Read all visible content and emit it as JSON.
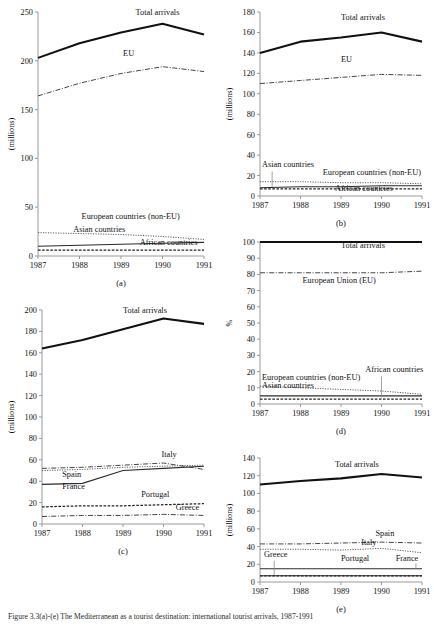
{
  "figure": {
    "caption": "Figure 3.3(a)-(e)  The Mediterranean as a tourist destination: international tourist arrivals, 1987-1991",
    "years": [
      1987,
      1988,
      1989,
      1990,
      1991
    ]
  },
  "chart_data": [
    {
      "id": "a",
      "type": "line",
      "panel_letter": "(a)",
      "title": "",
      "xlabel": "",
      "ylabel": "(millions)",
      "x": [
        1987,
        1988,
        1989,
        1990,
        1991
      ],
      "xticks": [
        "1987",
        "1988",
        "1989",
        "1990",
        "1991"
      ],
      "yticks": [
        0,
        50,
        100,
        150,
        200,
        250
      ],
      "ylim": [
        0,
        250
      ],
      "grid": false,
      "legend": "inline-labels",
      "series": [
        {
          "name": "Total arrivals",
          "style": "solid-thick",
          "values": [
            203,
            218,
            229,
            238,
            227
          ],
          "label_x": 1989.35,
          "label_y": 247
        },
        {
          "name": "EU",
          "style": "dashdot",
          "values": [
            164,
            177,
            187,
            194,
            189
          ],
          "label_x": 1989.05,
          "label_y": 205
        },
        {
          "name": "European countries (non-EU)",
          "style": "dotted",
          "values": [
            24,
            23,
            22,
            20,
            17
          ],
          "label_x": 1988.05,
          "label_y": 38
        },
        {
          "name": "Asian countries",
          "style": "solid-thin",
          "values": [
            10,
            11,
            12,
            13,
            14
          ],
          "label_x": 1987.85,
          "label_y": 25
        },
        {
          "name": "African countries",
          "style": "dashed",
          "values": [
            6,
            6,
            6,
            6,
            6
          ],
          "label_x": 1989.45,
          "label_y": 11
        }
      ]
    },
    {
      "id": "b",
      "type": "line",
      "panel_letter": "(b)",
      "title": "",
      "xlabel": "",
      "ylabel": "(millions)",
      "x": [
        1987,
        1988,
        1989,
        1990,
        1991
      ],
      "xticks": [
        "1987",
        "1988",
        "1989",
        "1990",
        "1991"
      ],
      "yticks": [
        0,
        20,
        40,
        60,
        80,
        100,
        120,
        140,
        160,
        180
      ],
      "ylim": [
        0,
        180
      ],
      "grid": false,
      "legend": "inline-labels",
      "series": [
        {
          "name": "Total arrivals",
          "style": "solid-thick",
          "values": [
            140,
            151,
            155,
            160,
            151
          ],
          "label_x": 1989.0,
          "label_y": 172
        },
        {
          "name": "EU",
          "style": "dashdot",
          "values": [
            110,
            113,
            116,
            119,
            118
          ],
          "label_x": 1989.0,
          "label_y": 131
        },
        {
          "name": "Asian countries",
          "style": "solid-thin",
          "values": [
            8,
            9,
            9,
            10,
            10
          ],
          "label_x": 1987.05,
          "label_y": 28,
          "leader": {
            "x": 1987.3,
            "y0": 24,
            "y1": 9
          }
        },
        {
          "name": "European countries (non-EU)",
          "style": "dotted",
          "values": [
            14,
            14,
            13,
            13,
            12
          ],
          "label_x": 1988.55,
          "label_y": 21
        },
        {
          "name": "African countries",
          "style": "dashed",
          "values": [
            7,
            7,
            7,
            7,
            7
          ],
          "label_x": 1988.85,
          "label_y": 5
        }
      ]
    },
    {
      "id": "c",
      "type": "line",
      "panel_letter": "(c)",
      "title": "",
      "xlabel": "",
      "ylabel": "(millions)",
      "x": [
        1987,
        1988,
        1989,
        1990,
        1991
      ],
      "xticks": [
        "1987",
        "1988",
        "1989",
        "1990",
        "1991"
      ],
      "yticks": [
        0,
        20,
        40,
        60,
        80,
        100,
        120,
        140,
        160,
        180,
        200
      ],
      "ylim": [
        0,
        200
      ],
      "grid": false,
      "legend": "inline-labels",
      "series": [
        {
          "name": "Total arrivals",
          "style": "solid-thick",
          "values": [
            164,
            172,
            182,
            192,
            187
          ],
          "label_x": 1989.0,
          "label_y": 197
        },
        {
          "name": "Italy",
          "style": "dashdot",
          "values": [
            52,
            53,
            55,
            57,
            51
          ],
          "label_x": 1989.95,
          "label_y": 63
        },
        {
          "name": "Spain",
          "style": "dotted",
          "values": [
            50,
            51,
            53,
            54,
            55
          ],
          "label_x": 1987.5,
          "label_y": 44
        },
        {
          "name": "France",
          "style": "solid-thin",
          "values": [
            37,
            38,
            50,
            52,
            54
          ],
          "label_x": 1987.5,
          "label_y": 33
        },
        {
          "name": "Portugal",
          "style": "dashed",
          "values": [
            16,
            17,
            17,
            18,
            19
          ],
          "label_x": 1989.45,
          "label_y": 25
        },
        {
          "name": "Greece",
          "style": "dashdot",
          "values": [
            7,
            8,
            8,
            9,
            8
          ],
          "label_x": 1990.3,
          "label_y": 13
        }
      ]
    },
    {
      "id": "d",
      "type": "line",
      "panel_letter": "(d)",
      "title": "",
      "xlabel": "",
      "ylabel": "%",
      "x": [
        1987,
        1988,
        1989,
        1990,
        1991
      ],
      "xticks": [
        "1987",
        "1988",
        "1989",
        "1990",
        "1991"
      ],
      "yticks": [
        0,
        10,
        20,
        30,
        40,
        50,
        60,
        70,
        80,
        90,
        100
      ],
      "ylim": [
        0,
        100
      ],
      "grid": false,
      "legend": "inline-labels",
      "series": [
        {
          "name": "Total arrivals",
          "style": "solid-thick",
          "values": [
            100,
            100,
            100,
            100,
            100
          ],
          "label_x": 1989.0,
          "label_y": 96
        },
        {
          "name": "European Union (EU)",
          "style": "dashdot",
          "values": [
            81,
            81,
            81,
            81,
            82
          ],
          "label_x": 1988.05,
          "label_y": 75
        },
        {
          "name": "European countries (non-EU)",
          "style": "dotted",
          "values": [
            11,
            10,
            9,
            8,
            6
          ],
          "label_x": 1987.05,
          "label_y": 15
        },
        {
          "name": "Asian countries",
          "style": "solid-thin",
          "values": [
            5,
            5,
            5,
            5,
            5
          ],
          "label_x": 1987.05,
          "label_y": 10
        },
        {
          "name": "African countries",
          "style": "dashed",
          "values": [
            3,
            3,
            3,
            3,
            3
          ],
          "label_x": 1989.6,
          "label_y": 20,
          "leader": {
            "x": 1990.0,
            "y0": 17,
            "y1": 4
          }
        }
      ]
    },
    {
      "id": "e",
      "type": "line",
      "panel_letter": "(e)",
      "title": "",
      "xlabel": "",
      "ylabel": "(millions)",
      "x": [
        1987,
        1988,
        1989,
        1990,
        1991
      ],
      "xticks": [
        "1987",
        "1988",
        "1989",
        "1990",
        "1991"
      ],
      "yticks": [
        0,
        20,
        40,
        60,
        80,
        100,
        120,
        140
      ],
      "ylim": [
        0,
        140
      ],
      "grid": false,
      "legend": "inline-labels",
      "series": [
        {
          "name": "Total arrivals",
          "style": "solid-thick",
          "values": [
            110,
            114,
            117,
            122,
            118
          ],
          "label_x": 1988.85,
          "label_y": 130
        },
        {
          "name": "Spain",
          "style": "dashdot",
          "values": [
            43,
            43,
            44,
            45,
            44
          ],
          "label_x": 1989.85,
          "label_y": 52
        },
        {
          "name": "Italy",
          "style": "dotted",
          "values": [
            37,
            37,
            36,
            38,
            33
          ],
          "label_x": 1989.5,
          "label_y": 42
        },
        {
          "name": "France",
          "style": "solid-thin",
          "values": [
            15,
            15,
            15,
            15,
            15
          ],
          "label_x": 1990.35,
          "label_y": 24,
          "leader": {
            "x": 1990.85,
            "y0": 21,
            "y1": 15
          }
        },
        {
          "name": "Greece",
          "style": "solid-thin",
          "values": [
            7,
            7,
            7,
            7,
            7
          ],
          "label_x": 1987.1,
          "label_y": 28,
          "leader": {
            "x": 1987.35,
            "y0": 24,
            "y1": 8
          }
        },
        {
          "name": "Portugal",
          "style": "dashed",
          "values": [
            7,
            7,
            7,
            7,
            7
          ],
          "label_x": 1989.0,
          "label_y": 24
        }
      ]
    }
  ]
}
